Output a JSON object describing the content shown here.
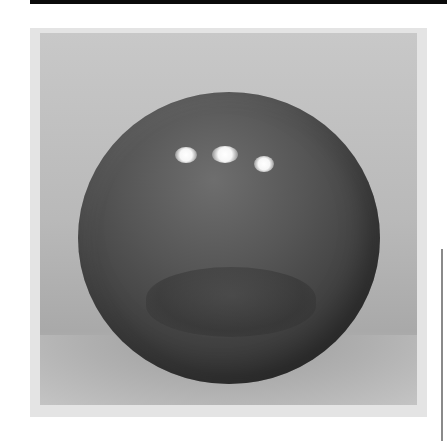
{
  "image": {
    "subject": "glossy dark sphere",
    "background": "light gray studio backdrop",
    "colors": {
      "backdrop": "#c0c0c0",
      "frame": "#e4e4e4",
      "sphere_dark": "#2c2c2c",
      "sphere_light": "#6e6e6e",
      "highlight": "#ffffff",
      "top_band": "#0a0a0a",
      "side_line": "#8a8a8a"
    },
    "specular_highlights": 3
  }
}
